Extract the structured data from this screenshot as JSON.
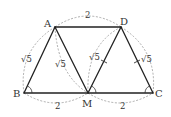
{
  "diagram": {
    "type": "geometry",
    "points": {
      "A": {
        "label": "A",
        "x": 55,
        "y": 27
      },
      "D": {
        "label": "D",
        "x": 121,
        "y": 27
      },
      "B": {
        "label": "B",
        "x": 24,
        "y": 93
      },
      "M": {
        "label": "M",
        "x": 88,
        "y": 93
      },
      "C": {
        "label": "C",
        "x": 153,
        "y": 93
      }
    },
    "segments": [
      "AD",
      "AB",
      "AM",
      "DM",
      "DC",
      "BC"
    ],
    "dashed_arcs": [
      "AD",
      "BM",
      "MC",
      "AB",
      "AM",
      "DM",
      "DC"
    ],
    "lengths": {
      "AD": "2",
      "BM": "2",
      "MC": "2",
      "AB": "√5",
      "AM": "√5",
      "DM": "√5",
      "DC": "√5"
    },
    "angle_marks": [
      "B",
      "M",
      "C"
    ],
    "tick_marks": [
      "DM",
      "DC"
    ],
    "colors": {
      "line": "#222222",
      "dash": "#888888",
      "text": "#333333",
      "background": "#ffffff"
    }
  }
}
